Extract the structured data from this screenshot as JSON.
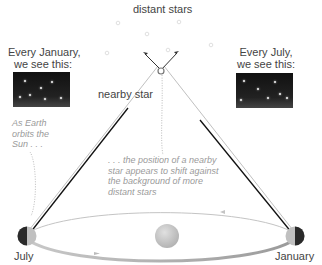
{
  "title": "distant stars",
  "left_panel": {
    "line1": "Every January,",
    "line2": "we see this:"
  },
  "right_panel": {
    "line1": "Every July,",
    "line2": "we see this:"
  },
  "nearby_star_label": "nearby star",
  "note_left": {
    "line1": "As Earth",
    "line2": "orbits the",
    "line3": "Sun . . ."
  },
  "note_center": {
    "line1": ". . . the position of a nearby",
    "line2": "star appears to shift against",
    "line3": "the background of more",
    "line4": "distant stars"
  },
  "earth_left_label": "July",
  "earth_right_label": "January",
  "colors": {
    "sky": "#1a1a1a",
    "sun": "#c8c8c8",
    "orbit": "#bbbbbb",
    "sightline": "#111111",
    "note": "#9a9a9a"
  },
  "icons": [
    "distant-star-icon",
    "nearby-star-icon",
    "earth-icon",
    "sun-icon"
  ]
}
